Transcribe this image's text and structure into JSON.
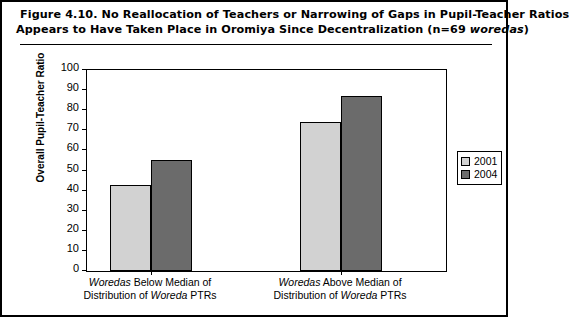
{
  "figure": {
    "label": "Figure 4.10.",
    "title_line_1": "Figure 4.10.   No Reallocation of Teachers or Narrowing of Gaps in Pupil-Teacher Ratios",
    "title_line_2_pre": "Appears to Have Taken Place in Oromiya Since Decentralization (n=69 ",
    "title_line_2_italic": "woredas",
    "title_line_2_post": ")"
  },
  "chart_data": {
    "type": "bar",
    "title": "Figure 4.10. No Reallocation of Teachers or Narrowing of Gaps in Pupil-Teacher Ratios Appears to Have Taken Place in Oromiya Since Decentralization (n=69 woredas)",
    "xlabel": "",
    "ylabel": "Overall Pupil-Teacher Ratio",
    "ylim": [
      0,
      100
    ],
    "ytick_step": 10,
    "yticks": [
      100,
      90,
      80,
      70,
      60,
      50,
      40,
      30,
      20,
      10,
      0
    ],
    "grid": false,
    "legend_position": "right",
    "categories": [
      {
        "line1_italic": "Woredas",
        "line1_rest": " Below Median of",
        "line2_pre": "Distribution of ",
        "line2_italic": "Woreda",
        "line2_post": " PTRs"
      },
      {
        "line1_italic": "Woredas",
        "line1_rest": " Above Median of",
        "line2_pre": "Distribution of ",
        "line2_italic": "Woreda",
        "line2_post": " PTRs"
      }
    ],
    "series": [
      {
        "name": "2001",
        "color": "#d2d2d2",
        "values": [
          43,
          74
        ]
      },
      {
        "name": "2004",
        "color": "#6b6b6b",
        "values": [
          55,
          87
        ]
      }
    ]
  },
  "legend": {
    "items": [
      {
        "label": "2001",
        "color": "#d2d2d2"
      },
      {
        "label": "2004",
        "color": "#6b6b6b"
      }
    ]
  }
}
